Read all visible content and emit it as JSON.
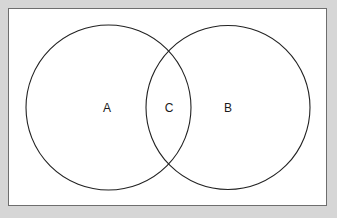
{
  "figure": {
    "type": "venn-diagram",
    "title": "",
    "frame": {
      "border_color": "#6e6e6e",
      "background_color": "#ffffff",
      "outer_background_color": "#d6d6d6"
    },
    "stroke_color": "#222222",
    "label_color": "#1a1a1a"
  },
  "chart_data": {
    "type": "diagram",
    "subtype": "venn",
    "title": "",
    "set_count": 2,
    "sets": [
      {
        "id": "A",
        "label": "A",
        "cx": 108.5,
        "cy": 107.5,
        "r": 82.5
      },
      {
        "id": "B",
        "label": "B",
        "cx": 228.0,
        "cy": 107.5,
        "r": 82.0
      }
    ],
    "regions": [
      {
        "id": "A-only",
        "label": "A",
        "x": 107,
        "y": 108
      },
      {
        "id": "A-and-B",
        "label": "C",
        "x": 169,
        "y": 108
      },
      {
        "id": "B-only",
        "label": "B",
        "x": 228,
        "y": 108
      }
    ],
    "labels": [
      "A",
      "C",
      "B"
    ],
    "intersection_points": [
      {
        "x": 168,
        "y": 47
      },
      {
        "x": 168,
        "y": 169
      }
    ],
    "legend": null,
    "grid": false
  }
}
